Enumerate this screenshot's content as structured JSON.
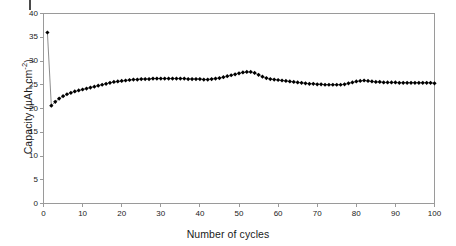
{
  "chart_data": {
    "type": "line",
    "title": "",
    "xlabel": "Number of cycles",
    "ylabel": "Capacity (µAh.cm⁻²)",
    "ylabel_text": "Capacity (µAh.cm",
    "ylabel_sup": "-2",
    "ylabel_tail": ")",
    "xlim": [
      0,
      100
    ],
    "ylim": [
      0,
      40
    ],
    "xticks": [
      0,
      10,
      20,
      30,
      40,
      50,
      60,
      70,
      80,
      90,
      100
    ],
    "yticks": [
      0,
      5,
      10,
      15,
      20,
      25,
      30,
      35,
      40
    ],
    "grid": false,
    "legend": null,
    "marker": "filled-diamond",
    "marker_color": "#000000",
    "line_color": "#808080",
    "series": [
      {
        "name": "Capacity vs cycle number",
        "x": [
          1,
          2,
          3,
          4,
          5,
          6,
          7,
          8,
          9,
          10,
          11,
          12,
          13,
          14,
          15,
          16,
          17,
          18,
          19,
          20,
          21,
          22,
          23,
          24,
          25,
          26,
          27,
          28,
          29,
          30,
          31,
          32,
          33,
          34,
          35,
          36,
          37,
          38,
          39,
          40,
          41,
          42,
          43,
          44,
          45,
          46,
          47,
          48,
          49,
          50,
          51,
          52,
          53,
          54,
          55,
          56,
          57,
          58,
          59,
          60,
          61,
          62,
          63,
          64,
          65,
          66,
          67,
          68,
          69,
          70,
          71,
          72,
          73,
          74,
          75,
          76,
          77,
          78,
          79,
          80,
          81,
          82,
          83,
          84,
          85,
          86,
          87,
          88,
          89,
          90,
          91,
          92,
          93,
          94,
          95,
          96,
          97,
          98,
          99,
          100
        ],
        "y": [
          36.0,
          20.6,
          21.4,
          22.1,
          22.6,
          23.0,
          23.3,
          23.6,
          23.8,
          24.0,
          24.2,
          24.4,
          24.6,
          24.8,
          25.0,
          25.2,
          25.4,
          25.6,
          25.7,
          25.8,
          25.9,
          26.0,
          26.1,
          26.1,
          26.2,
          26.2,
          26.2,
          26.3,
          26.3,
          26.3,
          26.3,
          26.3,
          26.3,
          26.3,
          26.3,
          26.3,
          26.2,
          26.2,
          26.2,
          26.2,
          26.1,
          26.1,
          26.2,
          26.3,
          26.4,
          26.6,
          26.8,
          27.0,
          27.2,
          27.4,
          27.6,
          27.7,
          27.7,
          27.5,
          27.1,
          26.7,
          26.4,
          26.2,
          26.1,
          26.0,
          25.9,
          25.8,
          25.7,
          25.6,
          25.5,
          25.4,
          25.3,
          25.2,
          25.2,
          25.1,
          25.1,
          25.0,
          25.0,
          25.0,
          25.0,
          25.0,
          25.1,
          25.3,
          25.5,
          25.7,
          25.8,
          25.9,
          25.8,
          25.7,
          25.6,
          25.6,
          25.5,
          25.5,
          25.5,
          25.5,
          25.4,
          25.4,
          25.4,
          25.4,
          25.4,
          25.4,
          25.4,
          25.4,
          25.4,
          25.3
        ]
      }
    ]
  }
}
